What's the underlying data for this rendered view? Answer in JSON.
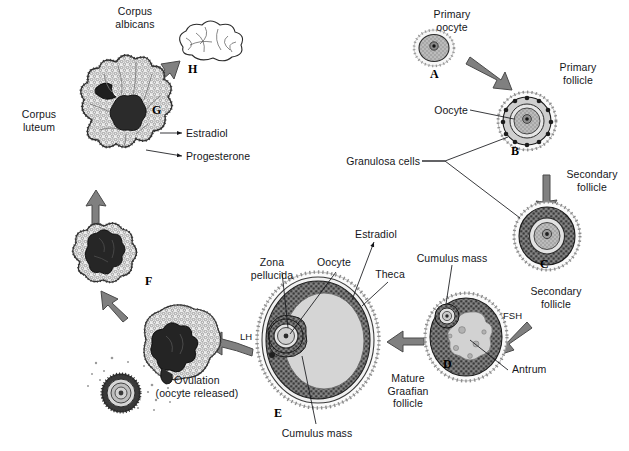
{
  "figure": {
    "background": "#ffffff",
    "ink": "#15161a",
    "arrow_fill": "#808080",
    "arrow_stroke": "#4a4a4a",
    "antrum_fill": "#d5d5d5",
    "granulosa_fill": "#6e6e6e",
    "dark_fill": "#2b2b2b",
    "light_tissue": "#e9e9e9"
  },
  "labels": {
    "corpus_albicans": "Corpus\nalbicans",
    "corpus_luteum": "Corpus\nluteum",
    "estradiol_luteum": "Estradiol",
    "progesterone": "Progesterone",
    "primary_oocyte": "Primary\noocyte",
    "primary_follicle": "Primary\nfollicle",
    "oocyte_b": "Oocyte",
    "granulosa_cells": "Granulosa cells",
    "secondary_follicle_c": "Secondary\nfollicle",
    "secondary_follicle_d": "Secondary\nfollicle",
    "antrum": "Antrum",
    "cumulus_mass_top": "Cumulus mass",
    "cumulus_mass_bottom": "Cumulus mass",
    "zona_pellucida": "Zona\npellucida",
    "oocyte_e": "Oocyte",
    "theca": "Theca",
    "estradiol_graafian": "Estradiol",
    "mature_graafian_follicle": "Mature\nGraafian\nfollicle",
    "ovulation": "Ovulation\n(oocyte released)",
    "fsh": "FSH",
    "lh": "LH"
  },
  "stage_letters": {
    "a": "A",
    "b": "B",
    "c": "C",
    "d": "D",
    "e": "E",
    "f": "F",
    "g": "G",
    "h": "H"
  },
  "stages": [
    {
      "id": "A",
      "name": "Primary oocyte"
    },
    {
      "id": "B",
      "name": "Primary follicle"
    },
    {
      "id": "C",
      "name": "Secondary follicle"
    },
    {
      "id": "D",
      "name": "Secondary follicle with antrum"
    },
    {
      "id": "E",
      "name": "Mature Graafian follicle"
    },
    {
      "id": "F",
      "name": "Ruptured follicle after ovulation"
    },
    {
      "id": "G",
      "name": "Corpus luteum"
    },
    {
      "id": "H",
      "name": "Corpus albicans"
    }
  ],
  "hormones": [
    {
      "name": "FSH",
      "acts_between": "C to D"
    },
    {
      "name": "LH",
      "acts_between": "E to ovulation"
    },
    {
      "name": "Estradiol",
      "secreted_by": "Mature Graafian follicle"
    },
    {
      "name": "Estradiol",
      "secreted_by": "Corpus luteum"
    },
    {
      "name": "Progesterone",
      "secreted_by": "Corpus luteum"
    }
  ]
}
